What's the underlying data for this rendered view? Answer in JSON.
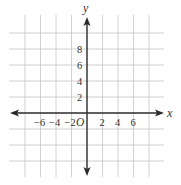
{
  "diagram": {
    "type": "coordinate-plane",
    "axes": {
      "x_label": "x",
      "y_label": "y",
      "origin_label": "O"
    },
    "x_ticks": [
      {
        "value": -6,
        "label": "−6"
      },
      {
        "value": -4,
        "label": "−4"
      },
      {
        "value": -2,
        "label": "−2"
      },
      {
        "value": 2,
        "label": "2"
      },
      {
        "value": 4,
        "label": "4"
      },
      {
        "value": 6,
        "label": "6"
      }
    ],
    "y_ticks": [
      {
        "value": 2,
        "label": "2"
      },
      {
        "value": 4,
        "label": "4"
      },
      {
        "value": 6,
        "label": "6"
      },
      {
        "value": 8,
        "label": "8"
      }
    ],
    "grid": {
      "visible": true,
      "unit_per_cell": 2,
      "x_range": [
        -10,
        10
      ],
      "y_range": [
        -8,
        12
      ]
    },
    "colors": {
      "grid": "#c4c4c4",
      "axis": "#2a2a2a",
      "text": "#333333"
    }
  }
}
